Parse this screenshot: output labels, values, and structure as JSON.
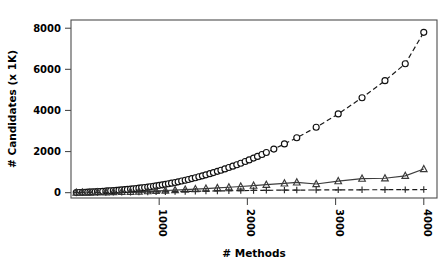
{
  "chart_data": {
    "type": "scatter",
    "title": "",
    "xlabel": "# Methods",
    "ylabel": "# Candidates (x 1K)",
    "xlim": [
      0,
      4150
    ],
    "ylim": [
      -260,
      8400
    ],
    "xticks": [
      1000,
      2000,
      3000,
      4000
    ],
    "xticklabels": [
      "1000",
      "2000",
      "3000",
      "4000"
    ],
    "yticks": [
      0,
      2000,
      4000,
      6000,
      8000
    ],
    "yticklabels": [
      "0",
      "2000",
      "4000",
      "6000",
      "8000"
    ],
    "grid": false,
    "legend": "none",
    "series": [
      {
        "name": "candidates-circles",
        "marker": "circle",
        "linestyle": "dashed",
        "color": "#111111",
        "points": [
          [
            60,
            4
          ],
          [
            95,
            8
          ],
          [
            130,
            14
          ],
          [
            160,
            18
          ],
          [
            190,
            24
          ],
          [
            215,
            30
          ],
          [
            245,
            36
          ],
          [
            275,
            44
          ],
          [
            300,
            50
          ],
          [
            330,
            58
          ],
          [
            360,
            66
          ],
          [
            395,
            76
          ],
          [
            420,
            84
          ],
          [
            450,
            92
          ],
          [
            480,
            100
          ],
          [
            515,
            112
          ],
          [
            545,
            122
          ],
          [
            575,
            132
          ],
          [
            610,
            146
          ],
          [
            640,
            158
          ],
          [
            675,
            172
          ],
          [
            705,
            186
          ],
          [
            740,
            204
          ],
          [
            770,
            218
          ],
          [
            800,
            234
          ],
          [
            835,
            252
          ],
          [
            870,
            272
          ],
          [
            900,
            290
          ],
          [
            935,
            312
          ],
          [
            965,
            332
          ],
          [
            1000,
            356
          ],
          [
            1035,
            380
          ],
          [
            1070,
            406
          ],
          [
            1105,
            434
          ],
          [
            1140,
            462
          ],
          [
            1180,
            496
          ],
          [
            1215,
            528
          ],
          [
            1255,
            566
          ],
          [
            1295,
            604
          ],
          [
            1330,
            640
          ],
          [
            1370,
            684
          ],
          [
            1410,
            726
          ],
          [
            1450,
            772
          ],
          [
            1490,
            818
          ],
          [
            1530,
            868
          ],
          [
            1575,
            924
          ],
          [
            1615,
            976
          ],
          [
            1660,
            1036
          ],
          [
            1700,
            1092
          ],
          [
            1745,
            1156
          ],
          [
            1790,
            1222
          ],
          [
            1835,
            1290
          ],
          [
            1880,
            1360
          ],
          [
            1925,
            1432
          ],
          [
            1975,
            1514
          ],
          [
            2020,
            1592
          ],
          [
            2070,
            1680
          ],
          [
            2115,
            1764
          ],
          [
            2165,
            1858
          ],
          [
            2215,
            1952
          ],
          [
            2300,
            2118
          ],
          [
            2420,
            2370
          ],
          [
            2560,
            2672
          ],
          [
            2780,
            3180
          ],
          [
            3030,
            3830
          ],
          [
            3300,
            4620
          ],
          [
            3560,
            5450
          ],
          [
            3790,
            6270
          ],
          [
            4000,
            7800
          ]
        ]
      },
      {
        "name": "candidates-triangles",
        "marker": "triangle",
        "linestyle": "solid",
        "color": "#3a3a3a",
        "points": [
          [
            60,
            2
          ],
          [
            130,
            5
          ],
          [
            215,
            9
          ],
          [
            300,
            14
          ],
          [
            395,
            20
          ],
          [
            480,
            27
          ],
          [
            575,
            36
          ],
          [
            675,
            46
          ],
          [
            770,
            58
          ],
          [
            870,
            72
          ],
          [
            965,
            86
          ],
          [
            1070,
            104
          ],
          [
            1180,
            124
          ],
          [
            1295,
            146
          ],
          [
            1410,
            170
          ],
          [
            1530,
            198
          ],
          [
            1660,
            228
          ],
          [
            1790,
            262
          ],
          [
            1925,
            300
          ],
          [
            2070,
            340
          ],
          [
            2215,
            386
          ],
          [
            2420,
            450
          ],
          [
            2560,
            500
          ],
          [
            2780,
            420
          ],
          [
            3030,
            560
          ],
          [
            3300,
            680
          ],
          [
            3560,
            700
          ],
          [
            3790,
            820
          ],
          [
            4000,
            1150
          ]
        ]
      },
      {
        "name": "candidates-plus",
        "marker": "plus",
        "linestyle": "dashed",
        "color": "#2b2b2b",
        "points": [
          [
            60,
            1
          ],
          [
            130,
            2
          ],
          [
            215,
            4
          ],
          [
            300,
            6
          ],
          [
            395,
            9
          ],
          [
            480,
            12
          ],
          [
            575,
            16
          ],
          [
            675,
            20
          ],
          [
            770,
            25
          ],
          [
            870,
            30
          ],
          [
            965,
            36
          ],
          [
            1070,
            42
          ],
          [
            1180,
            50
          ],
          [
            1295,
            58
          ],
          [
            1410,
            66
          ],
          [
            1530,
            74
          ],
          [
            1660,
            84
          ],
          [
            1790,
            92
          ],
          [
            1925,
            100
          ],
          [
            2070,
            108
          ],
          [
            2215,
            114
          ],
          [
            2420,
            122
          ],
          [
            2560,
            126
          ],
          [
            2780,
            130
          ],
          [
            3030,
            136
          ],
          [
            3300,
            140
          ],
          [
            3560,
            144
          ],
          [
            3790,
            148
          ],
          [
            4000,
            152
          ]
        ]
      }
    ]
  },
  "figure": {
    "background": "#ffffff",
    "frame_color": "#4d4d4d"
  }
}
